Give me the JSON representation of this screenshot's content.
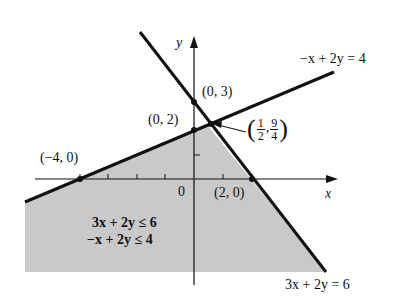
{
  "diagram": {
    "axes": {
      "x_label": "x",
      "y_label": "y",
      "origin_label": "0"
    },
    "lines": [
      {
        "equation": "3x + 2y = 6",
        "label": "3x + 2y = 6"
      },
      {
        "equation": "-x + 2y = 4",
        "label": "−x + 2y = 4"
      }
    ],
    "points": [
      {
        "label": "(0, 3)"
      },
      {
        "label": "(0, 2)"
      },
      {
        "label": "(−4, 0)"
      },
      {
        "label": "(2, 0)"
      },
      {
        "label_open": "(",
        "num1": "1",
        "den1": "2",
        "sep": ",",
        "num2": "9",
        "den2": "4",
        "label_close": ")"
      }
    ],
    "region": {
      "inequality_1": "3x + 2y ≤ 6",
      "inequality_2": "−x + 2y ≤ 4"
    },
    "colors": {
      "shade": "#c9c9c9",
      "line": "#111111",
      "background": "#ffffff"
    }
  }
}
